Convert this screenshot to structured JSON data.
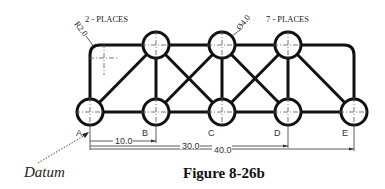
{
  "figure": {
    "caption": "Figure 8-26b",
    "datum_label": "Datum",
    "notes": {
      "radius_callout": "R2.0",
      "radius_places": "2 - PLACES",
      "diameter_callout": "Ø4.0",
      "diameter_places": "7 - PLACES"
    },
    "points": [
      {
        "label": "A"
      },
      {
        "label": "B"
      },
      {
        "label": "C"
      },
      {
        "label": "D"
      },
      {
        "label": "E"
      }
    ],
    "dimensions": [
      {
        "label": "10.0"
      },
      {
        "label": "30.0"
      },
      {
        "label": "40.0"
      }
    ]
  }
}
